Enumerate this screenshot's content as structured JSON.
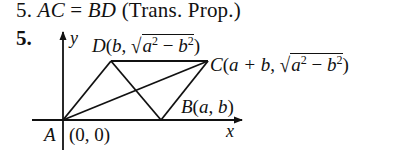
{
  "problem": {
    "line1": {
      "number": "5.",
      "lhs": "AC",
      "eq": "=",
      "rhs": "BD",
      "reason": "(Trans. Prop.)"
    },
    "figure_number": "5."
  },
  "diagram": {
    "axes": {
      "x_label": "x",
      "y_label": "y"
    },
    "points": {
      "A": {
        "name": "A",
        "coords": "(0, 0)"
      },
      "B": {
        "name": "B",
        "coords_open": "(",
        "a": "a",
        "sep": ", ",
        "b": "b",
        "coords_close": ")"
      },
      "C": {
        "name": "C",
        "open": "(",
        "expr": "a + b",
        "sep": ", ",
        "rad_a": "a",
        "exp": "2",
        "minus": " − ",
        "rad_b": "b",
        "close": ")"
      },
      "D": {
        "name": "D",
        "open": "(",
        "b": "b",
        "sep": ", ",
        "rad_a": "a",
        "exp": "2",
        "minus": " − ",
        "rad_b": "b",
        "close": ")"
      }
    },
    "segments": [
      "AD",
      "DC",
      "CB",
      "BA",
      "AC",
      "DB"
    ]
  }
}
